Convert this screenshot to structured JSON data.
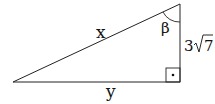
{
  "diagram": {
    "type": "right-triangle",
    "labels": {
      "hypotenuse": "x",
      "bottom_leg": "y",
      "angle": "β",
      "right_leg_coefficient": "3",
      "right_leg_radicand": "7"
    },
    "right_angle_marker": "•",
    "stroke_color": "#222222"
  }
}
